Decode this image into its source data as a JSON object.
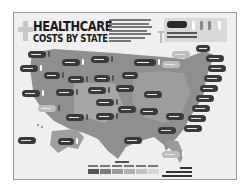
{
  "poster": {
    "title_line1": "HEALTHCARE",
    "title_line2": "COSTS BY STATE",
    "colors": {
      "background": "#efefef",
      "map_dark": "#8f8f8f",
      "map_light": "#c4c4c4",
      "bubble_dark": "#3a3a3a",
      "bubble_light": "#bdbdbd",
      "text": "#1a1a1a"
    }
  },
  "legend": {
    "swatch_colors": [
      "#555555",
      "#7a7a7a",
      "#999999",
      "#b0b0b0",
      "#c4c4c4",
      "#d6d6d6"
    ]
  }
}
